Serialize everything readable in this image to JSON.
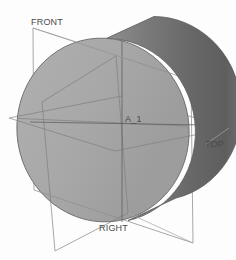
{
  "viewport": {
    "width": 236,
    "height": 260,
    "background_color": "#fdfdfd",
    "render_mode": "shaded"
  },
  "model": {
    "type": "cylinder",
    "description": "shaded solid cylinder (disc) viewed in trimetric orientation",
    "front_face_color": "#a9a9a9",
    "side_surface_color_light": "#8d8d8d",
    "side_surface_color_dark": "#5f5f5f",
    "edge_color": "#6b6b6b"
  },
  "datum_planes": [
    {
      "id": "front-plane",
      "label": "FRONT",
      "orientation": "vertical-frontal",
      "outline_color": "#9a9a9a"
    },
    {
      "id": "top-plane",
      "label": "TOP",
      "orientation": "horizontal",
      "outline_color": "#9a9a9a"
    },
    {
      "id": "right-plane",
      "label": "RIGHT",
      "orientation": "vertical-sagittal",
      "outline_color": "#9a9a9a"
    }
  ],
  "datum_axis": {
    "id": "axis-a1",
    "label": "A_1",
    "color": "#5a5a5a"
  },
  "labels": {
    "front": "FRONT",
    "top": "TOP",
    "right": "RIGHT",
    "axis": "A_1"
  }
}
